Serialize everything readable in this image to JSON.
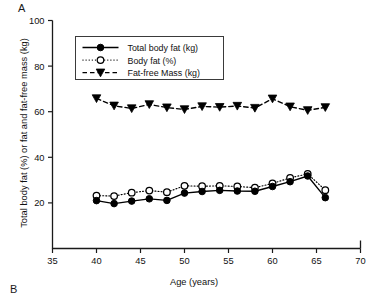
{
  "figure": {
    "panel_a_label": "A",
    "panel_b_label": "B"
  },
  "chart_data": {
    "type": "line",
    "title": "",
    "xlabel": "Age (years)",
    "ylabel": "Total body fat (%) or fat and fat-free mass (kg)",
    "xlim": [
      35,
      70
    ],
    "ylim": [
      0,
      100
    ],
    "xticks": [
      35,
      40,
      45,
      50,
      55,
      60,
      65,
      70
    ],
    "yticks": [
      0,
      20,
      40,
      60,
      80,
      100
    ],
    "ytick_labels": [
      "",
      "20",
      "40",
      "60",
      "80",
      "100"
    ],
    "grid": false,
    "legend_position": "upper-left-inside",
    "x": [
      40,
      42,
      44,
      46,
      48,
      50,
      52,
      54,
      56,
      58,
      60,
      62,
      64,
      66
    ],
    "series": [
      {
        "name": "Total body fat (kg)",
        "marker": "filled-circle",
        "linestyle": "solid",
        "color": "#000000",
        "values": [
          21.0,
          19.7,
          20.8,
          21.8,
          21.1,
          24.3,
          25.0,
          25.5,
          25.2,
          25.1,
          27.2,
          29.3,
          31.8,
          22.3
        ]
      },
      {
        "name": "Body fat (%)",
        "marker": "open-circle",
        "linestyle": "dotted",
        "color": "#000000",
        "values": [
          23.2,
          23.0,
          24.5,
          25.4,
          24.7,
          27.5,
          27.3,
          27.5,
          27.2,
          26.7,
          28.5,
          31.0,
          32.7,
          25.6
        ]
      },
      {
        "name": "Fat-free Mass (kg)",
        "marker": "filled-triangle-down",
        "linestyle": "dashed",
        "color": "#000000",
        "values": [
          65.8,
          62.6,
          61.4,
          63.2,
          61.8,
          61.0,
          62.3,
          62.0,
          62.5,
          61.6,
          65.7,
          62.2,
          60.6,
          61.9
        ]
      }
    ],
    "legend": [
      "Total body fat (kg)",
      "Body fat (%)",
      "Fat-free Mass (kg)"
    ]
  }
}
